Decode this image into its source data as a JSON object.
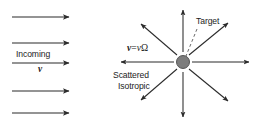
{
  "figure": {
    "type": "physics-scattering-diagram",
    "background_color": "#ffffff",
    "stroke_color": "#2b2b2b",
    "target_dot_color": "#7d7d7d",
    "target_dot_edge_color": "#4a4a4a"
  },
  "labels": {
    "incoming": "Incoming",
    "incoming_velocity": "v",
    "formula_vector_v": "v",
    "formula_equals": "=",
    "formula_scalar_v": "v",
    "formula_omega": "Ω",
    "target": "Target",
    "scattered": "Scattered",
    "isotropic": "Isotropic"
  },
  "incoming_beam": {
    "description": "five parallel horizontal arrows pointing right",
    "count": 5,
    "arrows": [
      {
        "x1": 12,
        "y1": 17,
        "x2": 69,
        "y2": 17
      },
      {
        "x1": 12,
        "y1": 43,
        "x2": 69,
        "y2": 43
      },
      {
        "x1": 12,
        "y1": 63,
        "x2": 69,
        "y2": 63
      },
      {
        "x1": 12,
        "y1": 91,
        "x2": 69,
        "y2": 91
      },
      {
        "x1": 12,
        "y1": 113,
        "x2": 69,
        "y2": 113
      }
    ]
  },
  "target": {
    "center_x": 183,
    "center_y": 62,
    "radius": 6.5
  },
  "scattered_rays": {
    "description": "eight arrows radiating outward from the target",
    "count": 8,
    "arrows": [
      {
        "angle_deg": 0,
        "x1": 192,
        "y1": 62,
        "x2": 249,
        "y2": 62
      },
      {
        "angle_deg": 45,
        "x1": 189,
        "y1": 55,
        "x2": 228,
        "y2": 23
      },
      {
        "angle_deg": 90,
        "x1": 183,
        "y1": 52,
        "x2": 183,
        "y2": 10
      },
      {
        "angle_deg": 135,
        "x1": 177,
        "y1": 55,
        "x2": 141,
        "y2": 24
      },
      {
        "angle_deg": 180,
        "x1": 174,
        "y1": 62,
        "x2": 121,
        "y2": 62
      },
      {
        "angle_deg": 225,
        "x1": 177,
        "y1": 69,
        "x2": 141,
        "y2": 100
      },
      {
        "angle_deg": 270,
        "x1": 183,
        "y1": 72,
        "x2": 183,
        "y2": 117
      },
      {
        "angle_deg": 315,
        "x1": 189,
        "y1": 69,
        "x2": 228,
        "y2": 101
      }
    ]
  },
  "leader_line": {
    "name": "target-leader",
    "style": "dashed",
    "x1": 197,
    "y1": 29,
    "x2": 186,
    "y2": 56
  }
}
